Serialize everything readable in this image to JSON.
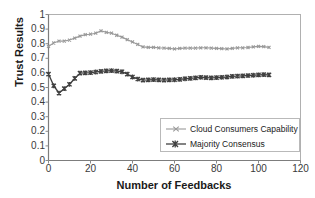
{
  "chart_data": {
    "type": "line",
    "title": "",
    "xlabel": "Number of Feedbacks",
    "ylabel": "Trust Results",
    "xlim": [
      0,
      120
    ],
    "ylim": [
      0,
      1
    ],
    "xticks": [
      "0",
      "20",
      "40",
      "60",
      "80",
      "100",
      "120"
    ],
    "yticks": [
      "0",
      "0.1",
      "0.2",
      "0.3",
      "0.4",
      "0.5",
      "0.6",
      "0.7",
      "0.8",
      "0.9",
      "1"
    ],
    "grid": false,
    "legend_position": "inside-lower-right",
    "series": [
      {
        "name": "Cloud Consumers Capability",
        "color": "#9a9a9a",
        "marker": "cross",
        "x": [
          0,
          2.5,
          5,
          7.5,
          10,
          12.5,
          15,
          17.5,
          20,
          22.5,
          25,
          27.5,
          30,
          32.5,
          35,
          37.5,
          40,
          42.5,
          45,
          47.5,
          50,
          52.5,
          55,
          57.5,
          60,
          62.5,
          65,
          67.5,
          70,
          72.5,
          75,
          77.5,
          80,
          82.5,
          85,
          87.5,
          90,
          92.5,
          95,
          97.5,
          100,
          102.5,
          105
        ],
        "values": [
          0.782,
          0.805,
          0.818,
          0.818,
          0.825,
          0.838,
          0.852,
          0.862,
          0.865,
          0.872,
          0.888,
          0.878,
          0.872,
          0.858,
          0.845,
          0.828,
          0.812,
          0.795,
          0.778,
          0.775,
          0.775,
          0.772,
          0.77,
          0.768,
          0.764,
          0.768,
          0.77,
          0.77,
          0.77,
          0.772,
          0.772,
          0.77,
          0.768,
          0.766,
          0.764,
          0.768,
          0.772,
          0.772,
          0.774,
          0.778,
          0.782,
          0.78,
          0.775
        ]
      },
      {
        "name": "Majority Consensus",
        "color": "#404040",
        "marker": "cross",
        "x": [
          0,
          2.5,
          5,
          7.5,
          10,
          12.5,
          15,
          17.5,
          20,
          22.5,
          25,
          27.5,
          30,
          32.5,
          35,
          37.5,
          40,
          42.5,
          45,
          47.5,
          50,
          52.5,
          55,
          57.5,
          60,
          62.5,
          65,
          67.5,
          70,
          72.5,
          75,
          77.5,
          80,
          82.5,
          85,
          87.5,
          90,
          92.5,
          95,
          97.5,
          100,
          102.5,
          105
        ],
        "values": [
          0.592,
          0.512,
          0.462,
          0.492,
          0.522,
          0.562,
          0.598,
          0.6,
          0.602,
          0.606,
          0.61,
          0.614,
          0.615,
          0.612,
          0.608,
          0.592,
          0.572,
          0.558,
          0.551,
          0.552,
          0.554,
          0.552,
          0.551,
          0.552,
          0.553,
          0.556,
          0.56,
          0.562,
          0.566,
          0.57,
          0.568,
          0.566,
          0.568,
          0.57,
          0.572,
          0.576,
          0.578,
          0.58,
          0.582,
          0.584,
          0.586,
          0.588,
          0.586
        ]
      }
    ]
  },
  "legend": {
    "items": [
      {
        "label": "Cloud Consumers Capability"
      },
      {
        "label": "Majority Consensus"
      }
    ]
  },
  "axes": {
    "frame_color": "#b0b0b0",
    "tick_color": "#8a8a8a"
  }
}
